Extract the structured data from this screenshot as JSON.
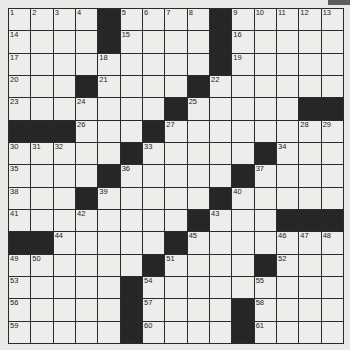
{
  "puzzle": {
    "size": 15,
    "rows": [
      "....#....#.....",
      "....#....#.....",
      ".........#.....",
      "...#....#......",
      ".......#.....##",
      "###...#........",
      ".....#.....#...",
      "....#.....#....",
      "...#.....#.....",
      "........#...###",
      "##.....#.......",
      "......#....#...",
      ".....#.........",
      ".....#....#....",
      ".....#....#...."
    ],
    "numbers": {
      "0,0": "1",
      "0,1": "2",
      "0,2": "3",
      "0,3": "4",
      "0,5": "5",
      "0,6": "6",
      "0,7": "7",
      "0,8": "8",
      "0,10": "9",
      "0,11": "10",
      "0,12": "11",
      "0,13": "12",
      "0,14": "13",
      "1,0": "14",
      "1,5": "15",
      "1,10": "16",
      "2,0": "17",
      "2,4": "18",
      "2,10": "19",
      "3,0": "20",
      "3,4": "21",
      "3,9": "22",
      "4,0": "23",
      "4,3": "24",
      "4,8": "25",
      "5,3": "26",
      "5,7": "27",
      "5,13": "28",
      "5,14": "29",
      "6,0": "30",
      "6,1": "31",
      "6,2": "32",
      "6,6": "33",
      "6,12": "34",
      "7,0": "35",
      "7,5": "36",
      "7,11": "37",
      "8,0": "38",
      "8,4": "39",
      "8,10": "40",
      "9,0": "41",
      "9,3": "42",
      "9,9": "43",
      "10,2": "44",
      "10,8": "45",
      "10,12": "46",
      "10,13": "47",
      "10,14": "48",
      "11,0": "49",
      "11,1": "50",
      "11,7": "51",
      "11,12": "52",
      "12,0": "53",
      "12,6": "54",
      "12,11": "55",
      "13,0": "56",
      "13,6": "57",
      "13,11": "58",
      "14,0": "59",
      "14,6": "60",
      "14,11": "61"
    }
  }
}
